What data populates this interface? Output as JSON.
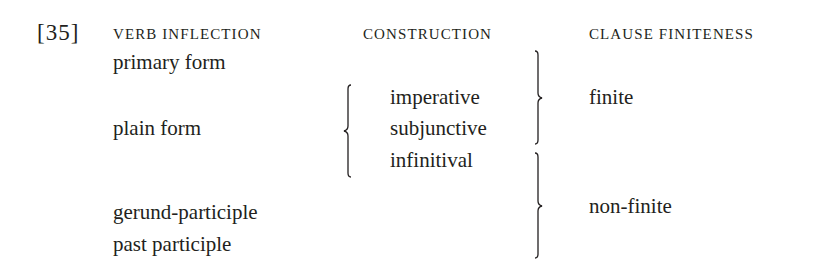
{
  "example": {
    "number": "[35]",
    "headers": {
      "verb_inflection": "verb inflection",
      "construction": "construction",
      "clause_finiteness": "clause finiteness"
    },
    "verb_inflection": [
      "primary form",
      "plain form",
      "gerund-participle",
      "past participle"
    ],
    "construction": [
      "imperative",
      "subjunctive",
      "infinitival"
    ],
    "clause_finiteness": [
      "finite",
      "non-finite"
    ]
  }
}
